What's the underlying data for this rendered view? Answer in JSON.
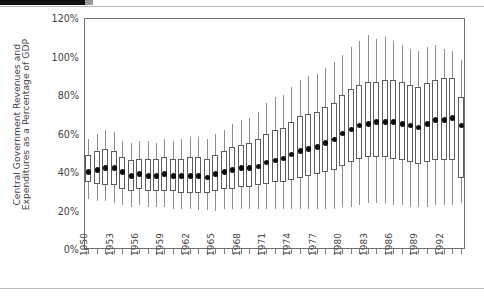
{
  "page": {
    "background_color": "#ffffff",
    "rule_color": "#b9b9b9",
    "top_bar_color": "#111111",
    "top_chip_color": "#9a9a9a"
  },
  "chart_data": {
    "type": "box",
    "title": "",
    "subtitle": "",
    "xlabel": "",
    "ylabel": "Central Government Revenues and Expenditures as a Percentage of GDP",
    "ylabel_line1": "Central Government Revenues and",
    "ylabel_line2": "Expenditures as a Percentage of GDP",
    "ylim": [
      0,
      120
    ],
    "y_major_ticks": [
      0,
      20,
      40,
      60,
      80,
      100,
      120
    ],
    "y_tick_labels": [
      "0%",
      "20%",
      "40%",
      "60%",
      "80%",
      "100%",
      "120%"
    ],
    "y_minor_ticks": [
      10,
      30,
      50,
      70,
      90,
      110
    ],
    "grid": false,
    "legend": "none",
    "x_label_interval": 3,
    "x_tick_labels": [
      "1950",
      "1953",
      "1956",
      "1959",
      "1962",
      "1965",
      "1968",
      "1971",
      "1974",
      "1977",
      "1980",
      "1983",
      "1986",
      "1989",
      "1992"
    ],
    "xlim": [
      1950,
      1994
    ],
    "categories": [
      1950,
      1951,
      1952,
      1953,
      1954,
      1955,
      1956,
      1957,
      1958,
      1959,
      1960,
      1961,
      1962,
      1963,
      1964,
      1965,
      1966,
      1967,
      1968,
      1969,
      1970,
      1971,
      1972,
      1973,
      1974,
      1975,
      1976,
      1977,
      1978,
      1979,
      1980,
      1981,
      1982,
      1983,
      1984,
      1985,
      1986,
      1987,
      1988,
      1989,
      1990,
      1991,
      1992,
      1993,
      1994
    ],
    "marker_label": "median",
    "marker_color": "#0d0d0d",
    "box_edge_color": "#5d5d5d",
    "box_fill_color": "#ffffff",
    "whisker_color": "#8c8c8c",
    "boxes": [
      {
        "year": 1950,
        "whisker_low": 26,
        "q1": 35,
        "median": 40,
        "q3": 49,
        "whisker_high": 57
      },
      {
        "year": 1951,
        "whisker_low": 25,
        "q1": 34,
        "median": 41,
        "q3": 51,
        "whisker_high": 60
      },
      {
        "year": 1952,
        "whisker_low": 25,
        "q1": 33,
        "median": 42,
        "q3": 52,
        "whisker_high": 62
      },
      {
        "year": 1953,
        "whisker_low": 24,
        "q1": 33,
        "median": 42,
        "q3": 51,
        "whisker_high": 61
      },
      {
        "year": 1954,
        "whisker_low": 23,
        "q1": 31,
        "median": 40,
        "q3": 48,
        "whisker_high": 56
      },
      {
        "year": 1955,
        "whisker_low": 22,
        "q1": 30,
        "median": 38,
        "q3": 46,
        "whisker_high": 55
      },
      {
        "year": 1956,
        "whisker_low": 23,
        "q1": 31,
        "median": 39,
        "q3": 47,
        "whisker_high": 56
      },
      {
        "year": 1957,
        "whisker_low": 22,
        "q1": 30,
        "median": 38,
        "q3": 47,
        "whisker_high": 56
      },
      {
        "year": 1958,
        "whisker_low": 22,
        "q1": 30,
        "median": 38,
        "q3": 47,
        "whisker_high": 55
      },
      {
        "year": 1959,
        "whisker_low": 22,
        "q1": 30,
        "median": 39,
        "q3": 48,
        "whisker_high": 57
      },
      {
        "year": 1960,
        "whisker_low": 21,
        "q1": 30,
        "median": 38,
        "q3": 47,
        "whisker_high": 56
      },
      {
        "year": 1961,
        "whisker_low": 21,
        "q1": 29,
        "median": 38,
        "q3": 47,
        "whisker_high": 57
      },
      {
        "year": 1962,
        "whisker_low": 21,
        "q1": 29,
        "median": 38,
        "q3": 48,
        "whisker_high": 58
      },
      {
        "year": 1963,
        "whisker_low": 20,
        "q1": 29,
        "median": 38,
        "q3": 48,
        "whisker_high": 58
      },
      {
        "year": 1964,
        "whisker_low": 20,
        "q1": 29,
        "median": 37,
        "q3": 47,
        "whisker_high": 57
      },
      {
        "year": 1965,
        "whisker_low": 20,
        "q1": 30,
        "median": 39,
        "q3": 49,
        "whisker_high": 60
      },
      {
        "year": 1966,
        "whisker_low": 21,
        "q1": 31,
        "median": 40,
        "q3": 51,
        "whisker_high": 62
      },
      {
        "year": 1967,
        "whisker_low": 21,
        "q1": 31,
        "median": 41,
        "q3": 53,
        "whisker_high": 65
      },
      {
        "year": 1968,
        "whisker_low": 21,
        "q1": 32,
        "median": 42,
        "q3": 54,
        "whisker_high": 67
      },
      {
        "year": 1969,
        "whisker_low": 21,
        "q1": 32,
        "median": 42,
        "q3": 55,
        "whisker_high": 68
      },
      {
        "year": 1970,
        "whisker_low": 21,
        "q1": 33,
        "median": 43,
        "q3": 57,
        "whisker_high": 71
      },
      {
        "year": 1971,
        "whisker_low": 21,
        "q1": 34,
        "median": 45,
        "q3": 60,
        "whisker_high": 76
      },
      {
        "year": 1972,
        "whisker_low": 21,
        "q1": 35,
        "median": 46,
        "q3": 62,
        "whisker_high": 79
      },
      {
        "year": 1973,
        "whisker_low": 21,
        "q1": 35,
        "median": 47,
        "q3": 63,
        "whisker_high": 80
      },
      {
        "year": 1974,
        "whisker_low": 21,
        "q1": 36,
        "median": 49,
        "q3": 66,
        "whisker_high": 84
      },
      {
        "year": 1975,
        "whisker_low": 21,
        "q1": 37,
        "median": 51,
        "q3": 69,
        "whisker_high": 88
      },
      {
        "year": 1976,
        "whisker_low": 21,
        "q1": 38,
        "median": 52,
        "q3": 70,
        "whisker_high": 90
      },
      {
        "year": 1977,
        "whisker_low": 21,
        "q1": 39,
        "median": 53,
        "q3": 71,
        "whisker_high": 91
      },
      {
        "year": 1978,
        "whisker_low": 21,
        "q1": 40,
        "median": 55,
        "q3": 74,
        "whisker_high": 94
      },
      {
        "year": 1979,
        "whisker_low": 21,
        "q1": 41,
        "median": 57,
        "q3": 76,
        "whisker_high": 97
      },
      {
        "year": 1980,
        "whisker_low": 22,
        "q1": 43,
        "median": 60,
        "q3": 80,
        "whisker_high": 101
      },
      {
        "year": 1981,
        "whisker_low": 22,
        "q1": 45,
        "median": 62,
        "q3": 83,
        "whisker_high": 105
      },
      {
        "year": 1982,
        "whisker_low": 23,
        "q1": 47,
        "median": 64,
        "q3": 85,
        "whisker_high": 108
      },
      {
        "year": 1983,
        "whisker_low": 24,
        "q1": 48,
        "median": 65,
        "q3": 87,
        "whisker_high": 111
      },
      {
        "year": 1984,
        "whisker_low": 24,
        "q1": 48,
        "median": 66,
        "q3": 87,
        "whisker_high": 109
      },
      {
        "year": 1985,
        "whisker_low": 24,
        "q1": 48,
        "median": 66,
        "q3": 88,
        "whisker_high": 110
      },
      {
        "year": 1986,
        "whisker_low": 23,
        "q1": 47,
        "median": 66,
        "q3": 88,
        "whisker_high": 108
      },
      {
        "year": 1987,
        "whisker_low": 23,
        "q1": 46,
        "median": 65,
        "q3": 87,
        "whisker_high": 106
      },
      {
        "year": 1988,
        "whisker_low": 22,
        "q1": 45,
        "median": 64,
        "q3": 85,
        "whisker_high": 104
      },
      {
        "year": 1989,
        "whisker_low": 22,
        "q1": 44,
        "median": 63,
        "q3": 84,
        "whisker_high": 103
      },
      {
        "year": 1990,
        "whisker_low": 22,
        "q1": 45,
        "median": 65,
        "q3": 86,
        "whisker_high": 105
      },
      {
        "year": 1991,
        "whisker_low": 23,
        "q1": 46,
        "median": 67,
        "q3": 88,
        "whisker_high": 106
      },
      {
        "year": 1992,
        "whisker_low": 23,
        "q1": 46,
        "median": 67,
        "q3": 89,
        "whisker_high": 104
      },
      {
        "year": 1993,
        "whisker_low": 23,
        "q1": 46,
        "median": 68,
        "q3": 89,
        "whisker_high": 103
      },
      {
        "year": 1994,
        "whisker_low": 24,
        "q1": 37,
        "median": 64,
        "q3": 79,
        "whisker_high": 98
      }
    ]
  },
  "plot_geometry": {
    "left": 84,
    "top": 18,
    "width": 381,
    "height": 231
  }
}
